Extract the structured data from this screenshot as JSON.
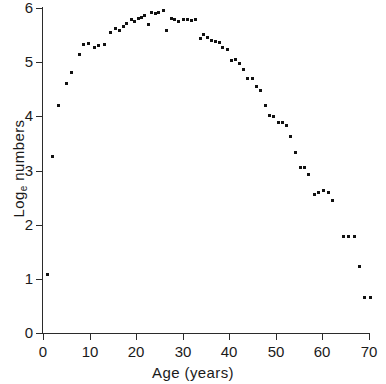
{
  "chart_data": {
    "type": "scatter",
    "title": "",
    "xlabel": "Age (years)",
    "ylabel": "Log_e numbers",
    "ylabel_base": "Log",
    "ylabel_sub": "e",
    "ylabel_rest": " numbers",
    "xlim": [
      0,
      71
    ],
    "ylim": [
      0,
      6
    ],
    "xticks": [
      0,
      10,
      20,
      30,
      40,
      50,
      60,
      70
    ],
    "xtick_labels": [
      "0",
      "10",
      "20",
      "30",
      "40",
      "50",
      "60",
      "70"
    ],
    "yticks": [
      0,
      1,
      2,
      3,
      4,
      5,
      6
    ],
    "ytick_labels": [
      "0",
      "1",
      "2",
      "3",
      "4",
      "5",
      "6"
    ],
    "grid": false,
    "legend": false,
    "marker": "square",
    "marker_color": "#111111",
    "axis_color": "#2b2b2b",
    "background": "#ffffff",
    "points": [
      {
        "x": 1.0,
        "y": 1.08
      },
      {
        "x": 2.0,
        "y": 3.25
      },
      {
        "x": 3.4,
        "y": 4.2
      },
      {
        "x": 5.0,
        "y": 4.6
      },
      {
        "x": 6.2,
        "y": 4.81
      },
      {
        "x": 7.8,
        "y": 5.15
      },
      {
        "x": 8.8,
        "y": 5.33
      },
      {
        "x": 9.7,
        "y": 5.34
      },
      {
        "x": 11.0,
        "y": 5.28
      },
      {
        "x": 12.0,
        "y": 5.3
      },
      {
        "x": 13.3,
        "y": 5.32
      },
      {
        "x": 14.5,
        "y": 5.55
      },
      {
        "x": 15.5,
        "y": 5.62
      },
      {
        "x": 16.5,
        "y": 5.58
      },
      {
        "x": 17.3,
        "y": 5.66
      },
      {
        "x": 18.0,
        "y": 5.72
      },
      {
        "x": 18.9,
        "y": 5.78
      },
      {
        "x": 19.6,
        "y": 5.76
      },
      {
        "x": 20.4,
        "y": 5.8
      },
      {
        "x": 21.2,
        "y": 5.83
      },
      {
        "x": 21.9,
        "y": 5.86
      },
      {
        "x": 22.6,
        "y": 5.7
      },
      {
        "x": 23.3,
        "y": 5.92
      },
      {
        "x": 24.1,
        "y": 5.9
      },
      {
        "x": 24.9,
        "y": 5.91
      },
      {
        "x": 25.8,
        "y": 5.95
      },
      {
        "x": 26.6,
        "y": 5.58
      },
      {
        "x": 27.5,
        "y": 5.8
      },
      {
        "x": 28.3,
        "y": 5.79
      },
      {
        "x": 29.2,
        "y": 5.76
      },
      {
        "x": 30.1,
        "y": 5.79
      },
      {
        "x": 31.0,
        "y": 5.78
      },
      {
        "x": 31.9,
        "y": 5.77
      },
      {
        "x": 32.8,
        "y": 5.78
      },
      {
        "x": 33.8,
        "y": 5.43
      },
      {
        "x": 34.5,
        "y": 5.52
      },
      {
        "x": 35.4,
        "y": 5.46
      },
      {
        "x": 36.2,
        "y": 5.4
      },
      {
        "x": 37.0,
        "y": 5.38
      },
      {
        "x": 37.9,
        "y": 5.36
      },
      {
        "x": 38.6,
        "y": 5.28
      },
      {
        "x": 39.6,
        "y": 5.23
      },
      {
        "x": 40.4,
        "y": 5.03
      },
      {
        "x": 41.3,
        "y": 5.05
      },
      {
        "x": 42.2,
        "y": 4.97
      },
      {
        "x": 43.1,
        "y": 4.87
      },
      {
        "x": 44.0,
        "y": 4.7
      },
      {
        "x": 44.9,
        "y": 4.7
      },
      {
        "x": 45.9,
        "y": 4.55
      },
      {
        "x": 46.8,
        "y": 4.48
      },
      {
        "x": 47.7,
        "y": 4.2
      },
      {
        "x": 48.6,
        "y": 4.02
      },
      {
        "x": 49.5,
        "y": 4.0
      },
      {
        "x": 50.5,
        "y": 3.88
      },
      {
        "x": 51.4,
        "y": 3.88
      },
      {
        "x": 52.3,
        "y": 3.84
      },
      {
        "x": 53.2,
        "y": 3.62
      },
      {
        "x": 54.2,
        "y": 3.33
      },
      {
        "x": 55.3,
        "y": 3.05
      },
      {
        "x": 56.2,
        "y": 3.05
      },
      {
        "x": 57.1,
        "y": 2.92
      },
      {
        "x": 58.2,
        "y": 2.55
      },
      {
        "x": 59.2,
        "y": 2.6
      },
      {
        "x": 60.2,
        "y": 2.63
      },
      {
        "x": 61.2,
        "y": 2.6
      },
      {
        "x": 62.2,
        "y": 2.45
      },
      {
        "x": 64.6,
        "y": 1.78
      },
      {
        "x": 65.7,
        "y": 1.78
      },
      {
        "x": 66.8,
        "y": 1.78
      },
      {
        "x": 68.0,
        "y": 1.22
      },
      {
        "x": 69.0,
        "y": 0.65
      },
      {
        "x": 70.4,
        "y": 0.65
      }
    ]
  }
}
